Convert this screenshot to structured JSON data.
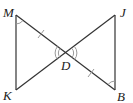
{
  "diagram": {
    "type": "geometry-figure",
    "points": {
      "M": {
        "label": "M",
        "x": 16,
        "y": 15
      },
      "J": {
        "label": "J",
        "x": 115,
        "y": 15
      },
      "K": {
        "label": "K",
        "x": 16,
        "y": 90
      },
      "B": {
        "label": "B",
        "x": 115,
        "y": 90
      },
      "D": {
        "label": "D",
        "x": 66,
        "y": 53
      }
    },
    "segments": [
      "MK",
      "MB",
      "KJ",
      "JB"
    ],
    "markings": {
      "congruent_segments": [
        "MD",
        "DB"
      ],
      "congruent_angles_single_arc": [
        "KMD",
        "JBD"
      ],
      "vertical_angles_double_arc": [
        "MDK",
        "JDB"
      ]
    },
    "colors": {
      "stroke": "#333333",
      "mark": "#999999"
    }
  }
}
